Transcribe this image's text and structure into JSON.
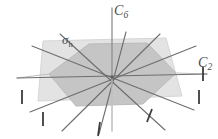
{
  "figure": {
    "name": "point-group-symmetry-diagram",
    "width": 218,
    "height": 139,
    "background_color": "#ffffff"
  },
  "labels": {
    "principal_axis": {
      "text": "C",
      "subscript": "6",
      "full": "C6",
      "meaning": "principal six-fold rotation axis",
      "color": "#4a4a4a"
    },
    "secondary_axis": {
      "text": "C",
      "subscript": "2",
      "full": "C2",
      "meaning": "two-fold rotation axis in plane",
      "color": "#4a4a4a"
    },
    "mirror_plane": {
      "text": "σ",
      "subscript": "h",
      "full": "σh",
      "meaning": "horizontal mirror plane",
      "color": "#4a4a4a"
    }
  },
  "colors": {
    "plane_fill": "#e2e2e2",
    "plane_stroke": "#d2d2d2",
    "hexagon_fill": "#c4c4c4",
    "hexagon_stroke": "#b6b6b6",
    "axis_line": "#6b6b6b",
    "axis_line_light": "#b9b9b9",
    "vertical_axis": "#8c8c8c",
    "tick_mark": "#3c3c3c",
    "label_text": "#4a4a4a"
  },
  "geometry": {
    "center": {
      "x": 112,
      "y": 77
    },
    "plane_parallelogram": [
      {
        "x": 43,
        "y": 41
      },
      {
        "x": 166,
        "y": 38
      },
      {
        "x": 182,
        "y": 96
      },
      {
        "x": 38,
        "y": 101
      }
    ],
    "hexagon": [
      {
        "x": 89,
        "y": 44
      },
      {
        "x": 147,
        "y": 43
      },
      {
        "x": 176,
        "y": 73
      },
      {
        "x": 143,
        "y": 104
      },
      {
        "x": 76,
        "y": 106
      },
      {
        "x": 49,
        "y": 74
      }
    ],
    "vertical_axis": {
      "top": {
        "x": 112,
        "y": 8
      },
      "bottom": {
        "x": 112,
        "y": 131
      }
    },
    "c2_axes": [
      {
        "id": "c2-horizontal",
        "x1": 17,
        "y1": 78,
        "x2": 207,
        "y2": 74,
        "tick_end": "both"
      },
      {
        "id": "c2-diag-a",
        "x1": 30,
        "y1": 112,
        "x2": 196,
        "y2": 46,
        "tick_end": "start"
      },
      {
        "id": "c2-diag-b",
        "x1": 32,
        "y1": 46,
        "x2": 194,
        "y2": 110,
        "tick_end": "end"
      },
      {
        "id": "c2-diag-c",
        "x1": 62,
        "y1": 131,
        "x2": 160,
        "y2": 34,
        "tick_end": "start"
      },
      {
        "id": "c2-diag-d",
        "x1": 60,
        "y1": 34,
        "x2": 165,
        "y2": 130,
        "tick_end": "end"
      },
      {
        "id": "c2-steep",
        "x1": 99,
        "y1": 134,
        "x2": 126,
        "y2": 32,
        "tick_end": "start"
      }
    ],
    "tick_marks": [
      {
        "id": "tick-left",
        "x": 22,
        "y": 97,
        "angle": 0
      },
      {
        "id": "tick-right",
        "x": 199,
        "y": 97,
        "angle": 0
      },
      {
        "id": "tick-c2-right",
        "x": 203,
        "y": 74,
        "angle": 0
      },
      {
        "id": "tick-lower-left",
        "x": 43,
        "y": 119,
        "angle": 0
      },
      {
        "id": "tick-lower-right",
        "x": 150,
        "y": 116,
        "angle": 20
      },
      {
        "id": "tick-bottom",
        "x": 99,
        "y": 129,
        "angle": 6
      }
    ]
  }
}
